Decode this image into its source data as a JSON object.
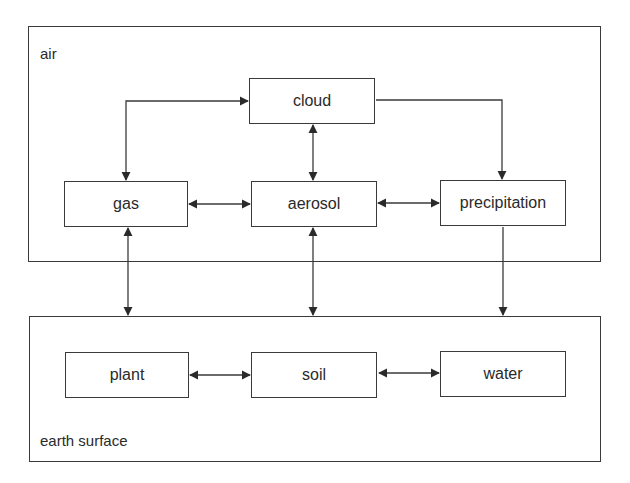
{
  "regions": {
    "air": {
      "label": "air"
    },
    "earth": {
      "label": "earth surface"
    }
  },
  "nodes": {
    "cloud": "cloud",
    "gas": "gas",
    "aerosol": "aerosol",
    "precipitation": "precipitation",
    "plant": "plant",
    "soil": "soil",
    "water": "water"
  },
  "edges": [
    {
      "from": "gas",
      "to": "cloud",
      "direction": "bidirectional"
    },
    {
      "from": "cloud",
      "to": "aerosol",
      "direction": "bidirectional"
    },
    {
      "from": "cloud",
      "to": "precipitation",
      "direction": "forward"
    },
    {
      "from": "gas",
      "to": "aerosol",
      "direction": "bidirectional"
    },
    {
      "from": "aerosol",
      "to": "precipitation",
      "direction": "bidirectional"
    },
    {
      "from": "gas",
      "to": "earth surface",
      "direction": "bidirectional"
    },
    {
      "from": "aerosol",
      "to": "earth surface",
      "direction": "bidirectional"
    },
    {
      "from": "precipitation",
      "to": "earth surface",
      "direction": "forward"
    },
    {
      "from": "plant",
      "to": "soil",
      "direction": "bidirectional"
    },
    {
      "from": "soil",
      "to": "water",
      "direction": "bidirectional"
    }
  ],
  "colors": {
    "line": "#3a3a3a",
    "text": "#2a2a2a",
    "background": "#ffffff"
  }
}
